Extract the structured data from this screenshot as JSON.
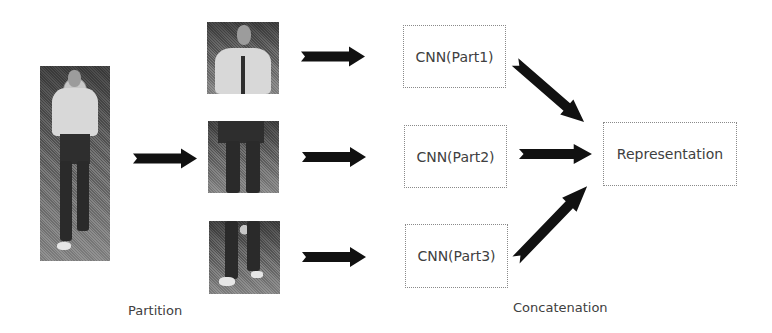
{
  "diagram": {
    "type": "pipeline",
    "stages": [
      {
        "id": "input",
        "label": "Full-body pedestrian image"
      },
      {
        "id": "partition",
        "label": "Partition"
      },
      {
        "id": "cnn",
        "label": "CNN per part"
      },
      {
        "id": "concatenation",
        "label": "Concatenation"
      },
      {
        "id": "output",
        "label": "Representation"
      }
    ],
    "parts": [
      {
        "name": "Part1",
        "region": "upper body",
        "cnn_label": "CNN(Part1)"
      },
      {
        "name": "Part2",
        "region": "middle body",
        "cnn_label": "CNN(Part2)"
      },
      {
        "name": "Part3",
        "region": "lower body",
        "cnn_label": "CNN(Part3)"
      }
    ],
    "output_label": "Representation",
    "captions": {
      "partition": "Partition",
      "concatenation": "Concatenation"
    },
    "colors": {
      "arrow": "#111111",
      "box_border": "#8a8a8a",
      "text": "#404040",
      "background": "#ffffff"
    }
  }
}
